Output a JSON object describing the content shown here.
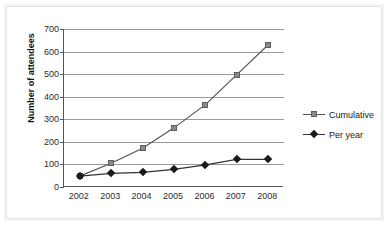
{
  "chart_data": {
    "type": "line",
    "title": "",
    "xlabel": "",
    "ylabel": "Number of attendees",
    "categories": [
      "2002",
      "2003",
      "2004",
      "2005",
      "2006",
      "2007",
      "2008"
    ],
    "x": [
      2002,
      2003,
      2004,
      2005,
      2006,
      2007,
      2008
    ],
    "series": [
      {
        "name": "Cumulative",
        "marker": "square",
        "color": "#8a8a8a",
        "line_color": "#555555",
        "values": [
          48,
          105,
          172,
          262,
          365,
          498,
          630
        ]
      },
      {
        "name": "Per year",
        "marker": "diamond",
        "color": "#1a1a1a",
        "line_color": "#333333",
        "values": [
          48,
          60,
          65,
          78,
          98,
          122,
          122
        ]
      }
    ],
    "ylim": [
      0,
      700
    ],
    "yticks": [
      0,
      100,
      200,
      300,
      400,
      500,
      600,
      700
    ],
    "ytick_labels": [
      "0",
      "100",
      "200",
      "300",
      "400",
      "500",
      "600",
      "700"
    ],
    "grid": true,
    "grid_axis": "y",
    "legend_position": "right",
    "legend": [
      "Cumulative",
      "Per year"
    ]
  },
  "colors": {
    "grid": "#9a9a9a",
    "axis": "#555555",
    "frame": "#e2e2e2",
    "background": "#ffffff",
    "cumulative": "#8a8a8a",
    "per_year": "#1a1a1a"
  }
}
